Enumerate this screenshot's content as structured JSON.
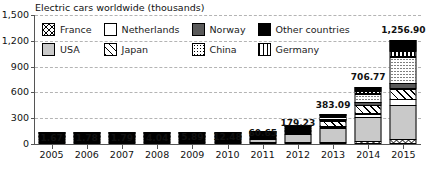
{
  "chart_data": {
    "type": "bar",
    "subtype": "stacked-bar",
    "title": "Electric cars worldwide (thousands)",
    "xlabel": "",
    "ylabel": "",
    "ylim": [
      0,
      1500
    ],
    "yticks": [
      0,
      300,
      600,
      900,
      1200,
      1500
    ],
    "ytick_labels": [
      "0",
      "300",
      "600",
      "900",
      "1,200",
      "1,500"
    ],
    "grid": "horizontal-dashed",
    "legend_position": "top-inside",
    "categories": [
      "2005",
      "2006",
      "2007",
      "2008",
      "2009",
      "2010",
      "2011",
      "2012",
      "2013",
      "2014",
      "2015"
    ],
    "totals": [
      1.67,
      1.78,
      1.79,
      4.04,
      5.89,
      12.48,
      60.65,
      179.23,
      383.09,
      706.77,
      1256.9
    ],
    "total_labels": [
      "1.67",
      "1.78",
      "1.79",
      "4.04",
      "5.89",
      "12.48",
      "60.65",
      "179.23",
      "383.09",
      "706.77",
      "1,256.90"
    ],
    "series": [
      {
        "name": "France",
        "pattern": "crosshatch",
        "color": "#ffffff",
        "values": [
          0.05,
          0.06,
          0.06,
          0.12,
          0.2,
          0.4,
          2.6,
          9.3,
          18.9,
          31.5,
          54.3
        ]
      },
      {
        "name": "USA",
        "pattern": "solid-light-gray",
        "color": "#c9c9c9",
        "values": [
          1.1,
          1.15,
          1.15,
          2.6,
          3.7,
          7.5,
          37.0,
          96.7,
          171.4,
          290.2,
          404.1
        ]
      },
      {
        "name": "Netherlands",
        "pattern": "solid-white",
        "color": "#ffffff",
        "values": [
          0.02,
          0.02,
          0.02,
          0.05,
          0.1,
          0.3,
          1.2,
          6.3,
          28.7,
          43.8,
          78.2
        ]
      },
      {
        "name": "Japan",
        "pattern": "diagonal-stripes",
        "color": "#ffffff",
        "values": [
          0.15,
          0.16,
          0.16,
          0.4,
          0.6,
          1.5,
          10.0,
          28.0,
          69.5,
          108.2,
          126.4
        ]
      },
      {
        "name": "Norway",
        "pattern": "solid-dark-gray",
        "color": "#5a5a5a",
        "values": [
          0.1,
          0.11,
          0.11,
          0.25,
          0.4,
          0.9,
          4.4,
          10.0,
          21.0,
          43.0,
          74.0
        ]
      },
      {
        "name": "China",
        "pattern": "dotted",
        "color": "#ffffff",
        "values": [
          0.1,
          0.11,
          0.11,
          0.25,
          0.4,
          1.0,
          2.5,
          11.6,
          32.2,
          105.4,
          312.8
        ]
      },
      {
        "name": "Germany",
        "pattern": "vertical-stripes",
        "color": "#ffffff",
        "values": [
          0.05,
          0.06,
          0.06,
          0.12,
          0.2,
          0.4,
          1.9,
          5.8,
          17.5,
          30.4,
          72.7
        ]
      },
      {
        "name": "Other countries",
        "pattern": "solid-black",
        "color": "#000000",
        "values": [
          0.1,
          0.11,
          0.12,
          0.25,
          0.29,
          0.48,
          1.05,
          11.53,
          23.89,
          54.27,
          134.4
        ]
      }
    ]
  },
  "legend": {
    "items": [
      {
        "label": "France",
        "swatch": "crosshatch-swatch"
      },
      {
        "label": "Netherlands",
        "swatch": "white-swatch"
      },
      {
        "label": "Norway",
        "swatch": "dark-gray-swatch"
      },
      {
        "label": "Other countries",
        "swatch": "black-swatch"
      },
      {
        "label": "USA",
        "swatch": "light-gray-swatch"
      },
      {
        "label": "Japan",
        "swatch": "diagonal-stripe-swatch"
      },
      {
        "label": "China",
        "swatch": "dotted-swatch"
      },
      {
        "label": "Germany",
        "swatch": "vertical-stripe-swatch"
      }
    ]
  }
}
